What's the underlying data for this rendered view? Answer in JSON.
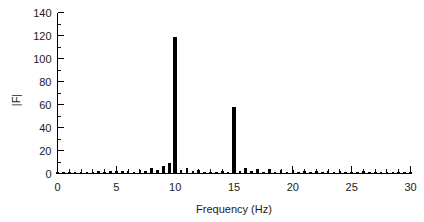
{
  "chart_data": {
    "type": "bar",
    "title": "",
    "xlabel": "Frequency (Hz)",
    "ylabel": "|F|",
    "xlim": [
      0,
      30
    ],
    "ylim": [
      0,
      140
    ],
    "grid": false,
    "legend": null,
    "x_major_ticks": [
      0,
      5,
      10,
      15,
      20,
      25,
      30
    ],
    "x_major_tick_labels": [
      "0",
      "5",
      "10",
      "15",
      "20",
      "25",
      "30"
    ],
    "x_minor_tick_step": 1,
    "y_major_ticks": [
      0,
      20,
      40,
      60,
      80,
      100,
      120,
      140
    ],
    "y_major_tick_labels": [
      "0",
      "20",
      "40",
      "60",
      "80",
      "100",
      "120",
      "140"
    ],
    "y_minor_tick_step": 10,
    "series_name": "FFT magnitude",
    "bar_color": "#000000",
    "x": [
      0.0,
      0.5,
      1.0,
      1.5,
      2.0,
      2.5,
      3.0,
      3.5,
      4.0,
      4.5,
      5.0,
      5.5,
      6.0,
      6.5,
      7.0,
      7.5,
      8.0,
      8.5,
      9.0,
      9.5,
      10.0,
      10.5,
      11.0,
      11.5,
      12.0,
      12.5,
      13.0,
      13.5,
      14.0,
      14.5,
      15.0,
      15.5,
      16.0,
      16.5,
      17.0,
      17.5,
      18.0,
      18.5,
      19.0,
      19.5,
      20.0,
      20.5,
      21.0,
      21.5,
      22.0,
      22.5,
      23.0,
      23.5,
      24.0,
      24.5,
      25.0,
      25.5,
      26.0,
      26.5,
      27.0,
      27.5,
      28.0,
      28.5,
      29.0,
      29.5,
      30.0
    ],
    "values": [
      0.6,
      0.5,
      0.7,
      0.6,
      0.8,
      0.7,
      1.0,
      1.6,
      1.1,
      1.5,
      1.8,
      2.0,
      1.4,
      1.2,
      2.2,
      1.6,
      4.0,
      2.2,
      6.0,
      9.0,
      118.0,
      2.2,
      4.5,
      1.6,
      3.0,
      1.3,
      1.0,
      0.9,
      1.4,
      1.1,
      57.0,
      1.5,
      4.5,
      1.4,
      3.8,
      1.3,
      3.2,
      1.2,
      2.6,
      1.0,
      2.2,
      1.0,
      2.0,
      0.9,
      1.8,
      0.9,
      1.6,
      0.8,
      1.4,
      0.8,
      1.2,
      0.8,
      1.8,
      0.7,
      0.9,
      0.6,
      0.8,
      0.6,
      0.7,
      0.5,
      0.6
    ],
    "peaks": [
      {
        "frequency": 10,
        "magnitude": 118
      },
      {
        "frequency": 15,
        "magnitude": 57
      }
    ]
  }
}
